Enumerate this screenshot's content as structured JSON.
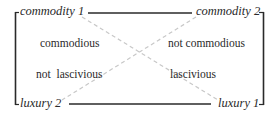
{
  "diagram": {
    "type": "semiotic-square",
    "colors": {
      "frame": "#2a2a2a",
      "diagonal": "#c8c8c8",
      "text": "#2a2a2a"
    },
    "corners": {
      "top_left": "commodity 1",
      "top_right": "commodity 2",
      "bottom_left": "luxury 2",
      "bottom_right": "luxury 1"
    },
    "inner_labels": {
      "upper_left": "commodious",
      "upper_right": "not commodious",
      "lower_left": "not  lascivious",
      "lower_right": "lascivious"
    }
  }
}
